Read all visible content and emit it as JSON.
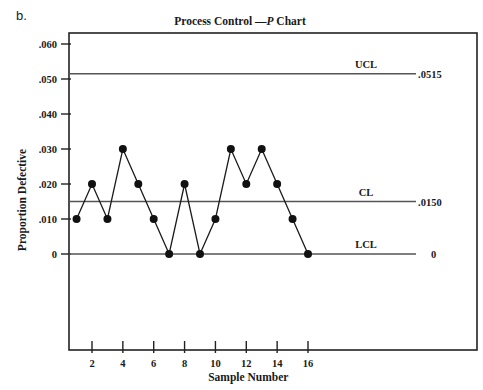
{
  "panel_label": "b.",
  "chart_data": {
    "type": "line",
    "title": "Process Control —P Chart",
    "title_prefix": "Process Control  —",
    "title_italic": "P",
    "title_suffix": " Chart",
    "xlabel": "Sample Number",
    "ylabel": "Proportion Defective",
    "x": [
      1,
      2,
      3,
      4,
      5,
      6,
      7,
      8,
      9,
      10,
      11,
      12,
      13,
      14,
      15,
      16
    ],
    "values": [
      0.01,
      0.02,
      0.01,
      0.03,
      0.02,
      0.01,
      0.0,
      0.02,
      0.0,
      0.01,
      0.03,
      0.02,
      0.03,
      0.02,
      0.01,
      0.0
    ],
    "x_ticks": [
      "2",
      "4",
      "6",
      "8",
      "10",
      "12",
      "14",
      "16"
    ],
    "y_ticks": [
      ".060",
      ".050",
      ".040",
      ".030",
      ".020",
      ".010",
      "0"
    ],
    "ylim": [
      0,
      0.06
    ],
    "grid": false,
    "control_lines": [
      {
        "name": "UCL",
        "value": 0.0515,
        "label": ".0515"
      },
      {
        "name": "CL",
        "value": 0.015,
        "label": ".0150"
      },
      {
        "name": "LCL",
        "value": 0,
        "label": "0"
      }
    ],
    "marker": "filled-circle",
    "line_color": "#1a1a1a",
    "control_line_color": "#555555"
  }
}
